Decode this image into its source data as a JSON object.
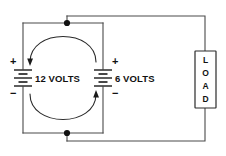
{
  "diagram": {
    "type": "electrical-schematic",
    "background_color": "#ffffff",
    "wire_color": "#4a4a4a",
    "ink_color": "#111111"
  },
  "sources": [
    {
      "id": "battery-left",
      "label": "12 VOLTS",
      "voltage": 12,
      "unit": "VOLTS",
      "plus_sign": "+",
      "minus_sign": "−",
      "plus_position": "top",
      "minus_position": "bottom",
      "cells": 2
    },
    {
      "id": "battery-right",
      "label": "6 VOLTS",
      "voltage": 6,
      "unit": "VOLTS",
      "plus_sign": "+",
      "minus_sign": "−",
      "plus_position": "top",
      "minus_position": "bottom",
      "cells": 2
    }
  ],
  "load": {
    "id": "load-block",
    "label": "LOAD",
    "letters": [
      "L",
      "O",
      "A",
      "D"
    ],
    "orientation": "vertical"
  },
  "current_loop": {
    "id": "internal-circulating-current",
    "direction": "counterclockwise",
    "arrow_count": 2,
    "arrow_top_label": "left-descending-arrow",
    "arrow_bottom_label": "right-ascending-arrow"
  },
  "junctions": [
    {
      "id": "top-node",
      "label": "top junction dot"
    },
    {
      "id": "bottom-node",
      "label": "bottom junction dot"
    }
  ]
}
